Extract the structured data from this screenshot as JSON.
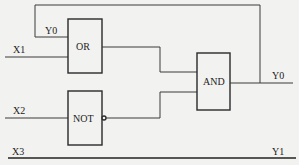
{
  "diagram": {
    "type": "logic-circuit",
    "inputs": [
      {
        "id": "Y0_feedback",
        "label": "Y0"
      },
      {
        "id": "X1",
        "label": "X1"
      },
      {
        "id": "X2",
        "label": "X2"
      },
      {
        "id": "X3",
        "label": "X3"
      }
    ],
    "gates": [
      {
        "id": "or_gate",
        "label": "OR",
        "inputs": [
          "Y0",
          "X1"
        ]
      },
      {
        "id": "not_gate",
        "label": "NOT",
        "inputs": [
          "X2"
        ],
        "output_inverted": true
      },
      {
        "id": "and_gate",
        "label": "AND",
        "inputs": [
          "OR",
          "NOT"
        ]
      }
    ],
    "outputs": [
      {
        "id": "Y0",
        "label": "Y0",
        "from": "AND",
        "feedback_to": "OR"
      },
      {
        "id": "Y1",
        "label": "Y1",
        "from": "X3"
      }
    ]
  }
}
